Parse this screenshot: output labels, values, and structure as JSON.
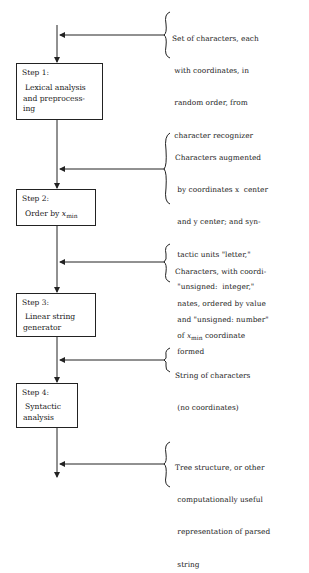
{
  "diagram": {
    "type": "flowchart",
    "steps": [
      {
        "id": "step1",
        "title": "Step 1:",
        "label_lines": [
          "Lexical analysis",
          "and preprocess-",
          "ing"
        ]
      },
      {
        "id": "step2",
        "title": "Step 2:",
        "label_prefix": "Order by ",
        "label_var": "x",
        "label_sub": "min"
      },
      {
        "id": "step3",
        "title": "Step 3:",
        "label_lines": [
          "Linear string",
          "generator"
        ]
      },
      {
        "id": "step4",
        "title": "Step 4:",
        "label_lines": [
          "Syntactic",
          "analysis"
        ]
      }
    ],
    "annotations": [
      {
        "id": "input",
        "lines": [
          "Set of characters, each",
          " with coordinates, in",
          " random order, from",
          " character recognizer"
        ]
      },
      {
        "id": "after-step1",
        "lines": [
          "Characters augmented",
          " by coordinates x  center",
          " and y center; and syn-",
          " tactic units \"letter,\"",
          " \"unsigned:  integer,\"",
          " and \"unsigned: number\"",
          " formed"
        ]
      },
      {
        "id": "after-step2",
        "line1": "Characters, with coordi-",
        "line2": " nates, ordered by value",
        "line3_prefix": " of ",
        "line3_var": "x",
        "line3_sub": "min",
        "line3_suffix": " coordinate"
      },
      {
        "id": "after-step3",
        "lines": [
          "String of characters",
          " (no coordinates)"
        ]
      },
      {
        "id": "after-step4",
        "lines": [
          "Tree structure, or other",
          " computationally useful",
          " representation of parsed",
          " string"
        ]
      }
    ]
  }
}
